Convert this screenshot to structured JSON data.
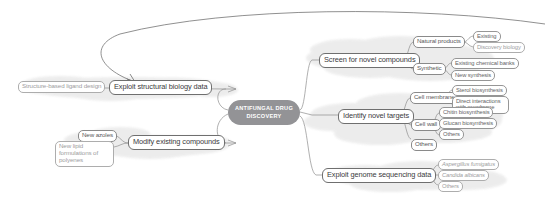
{
  "center": {
    "line1": "ANTIFUNGAL DRUG",
    "line2": "DISCOVERY",
    "fill": "#939396",
    "text_color": "#ffffff"
  },
  "branches": {
    "exploit_structural_biology": {
      "label": "Exploit structural biology data",
      "children": [
        {
          "label": "Structure-based ligand design",
          "style": "faded"
        }
      ]
    },
    "modify_existing": {
      "label": "Modify existing compounds",
      "children": [
        {
          "label": "New azoles",
          "style": "normal"
        },
        {
          "label": "New lipid formulations of polyenes",
          "style": "faded"
        }
      ]
    },
    "screen_novel_compounds": {
      "label": "Screen for novel compounds",
      "children": [
        {
          "label": "Natural products",
          "children": [
            {
              "label": "Existing"
            },
            {
              "label": "Discovery biology",
              "style": "faded"
            }
          ]
        },
        {
          "label": "Synthetic",
          "children": [
            {
              "label": "Existing chemical banks"
            },
            {
              "label": "New synthesis"
            }
          ]
        }
      ]
    },
    "identify_novel_targets": {
      "label": "Identify novel targets",
      "children": [
        {
          "label": "Cell membrane",
          "children": [
            {
              "label": "Sterol biosynthesis"
            },
            {
              "label": "Direct interactions with membrane"
            }
          ]
        },
        {
          "label": "Cell wall",
          "children": [
            {
              "label": "Chitin biosynthesis"
            },
            {
              "label": "Glucan biosynthesis"
            },
            {
              "label": "Others"
            }
          ]
        },
        {
          "label": "Others"
        }
      ]
    },
    "exploit_genome": {
      "label": "Exploit genome sequencing data",
      "children": [
        {
          "label": "Aspergillus fumigatus",
          "style": "italic-faded"
        },
        {
          "label": "Candida albicans",
          "style": "italic-faded"
        },
        {
          "label": "Others",
          "style": "faded"
        }
      ]
    }
  },
  "colors": {
    "line": "#8e8e8e",
    "cloud": "#ededed",
    "text": "#58585a"
  }
}
